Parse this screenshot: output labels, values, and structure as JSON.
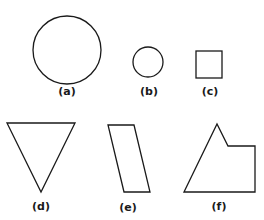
{
  "figure": {
    "shapes": [
      {
        "id": "a",
        "label": "(a)",
        "type": "circle",
        "size": "large"
      },
      {
        "id": "b",
        "label": "(b)",
        "type": "circle",
        "size": "small"
      },
      {
        "id": "c",
        "label": "(c)",
        "type": "square"
      },
      {
        "id": "d",
        "label": "(d)",
        "type": "inverted-triangle"
      },
      {
        "id": "e",
        "label": "(e)",
        "type": "parallelogram"
      },
      {
        "id": "f",
        "label": "(f)",
        "type": "pentagon"
      }
    ],
    "stroke_color": "#1a1a1a",
    "background": "#ffffff"
  }
}
